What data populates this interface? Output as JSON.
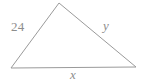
{
  "figure": {
    "type": "geometry-diagram",
    "shape": "triangle",
    "background_color": "#ffffff",
    "stroke_color": "#9a9a9a",
    "label_color": "#8d8d8d",
    "vertices": [
      {
        "name": "left-vertex",
        "x": 11,
        "y": 68
      },
      {
        "name": "apex-vertex",
        "x": 59,
        "y": 3
      },
      {
        "name": "right-vertex",
        "x": 136,
        "y": 67
      }
    ],
    "labels": {
      "left_side": "24",
      "right_side": "y",
      "bottom_side": "x"
    }
  }
}
